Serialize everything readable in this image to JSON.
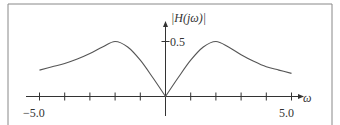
{
  "chart_data": {
    "type": "line",
    "title": "",
    "xlabel": "ω",
    "ylabel": "|H(jω)|",
    "xlim": [
      -5.0,
      5.0
    ],
    "ylim": [
      0,
      0.5
    ],
    "x_tick_labels": [
      "-5.0",
      "5.0"
    ],
    "x_ticks": [
      -5,
      -4,
      -3,
      -2,
      -1,
      0,
      1,
      2,
      3,
      4,
      5
    ],
    "y_tick_labels": [
      "0.5"
    ],
    "y_ticks": [
      0.5
    ],
    "grid": false,
    "legend": null,
    "series": [
      {
        "name": "|H(jω)|",
        "x": [
          -5,
          -4.5,
          -4,
          -3.5,
          -3,
          -2.5,
          -2,
          -1.5,
          -1,
          -0.5,
          0,
          0.5,
          1,
          1.5,
          2,
          2.5,
          3,
          3.5,
          4,
          4.5,
          5
        ],
        "values": [
          0.24,
          0.27,
          0.3,
          0.34,
          0.39,
          0.45,
          0.5,
          0.45,
          0.33,
          0.17,
          0.0,
          0.17,
          0.33,
          0.45,
          0.5,
          0.45,
          0.38,
          0.32,
          0.27,
          0.24,
          0.21
        ]
      }
    ],
    "colors": {
      "line": "#555555",
      "axis": "#333333",
      "frame": "#888888"
    }
  },
  "labels": {
    "y_axis": "|H(jω)|",
    "y_tick": "0.5",
    "x_axis": "ω",
    "x_min": "−5.0",
    "x_max": "5.0"
  }
}
